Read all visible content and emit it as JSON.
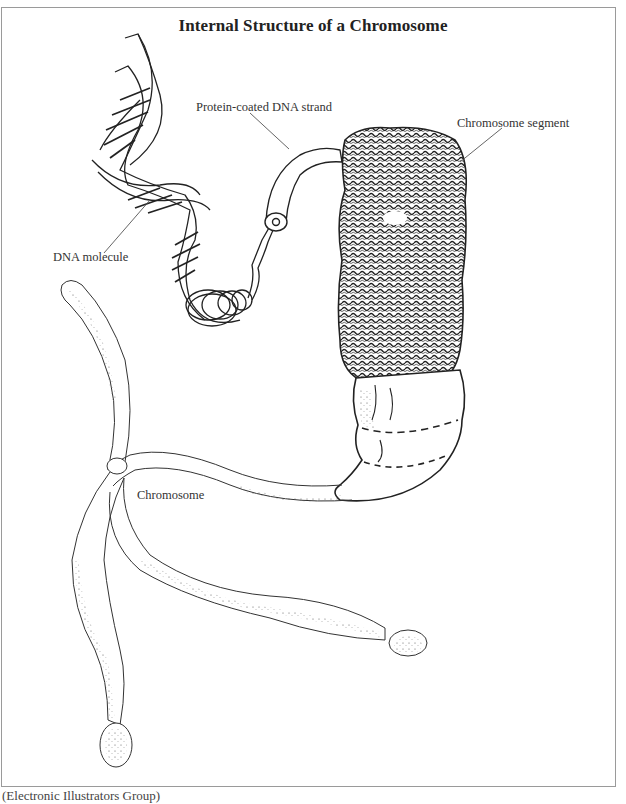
{
  "figure": {
    "title": "Internal Structure of a Chromosome",
    "labels": {
      "protein_coated_dna_strand": "Protein-coated DNA strand",
      "chromosome_segment": "Chromosome segment",
      "dna_molecule": "DNA molecule",
      "chromosome": "Chromosome"
    },
    "caption": "(Electronic Illustrators Group)"
  },
  "colors": {
    "line": "#2a2a2a",
    "frame": "#9a9a9a",
    "background": "#ffffff"
  }
}
